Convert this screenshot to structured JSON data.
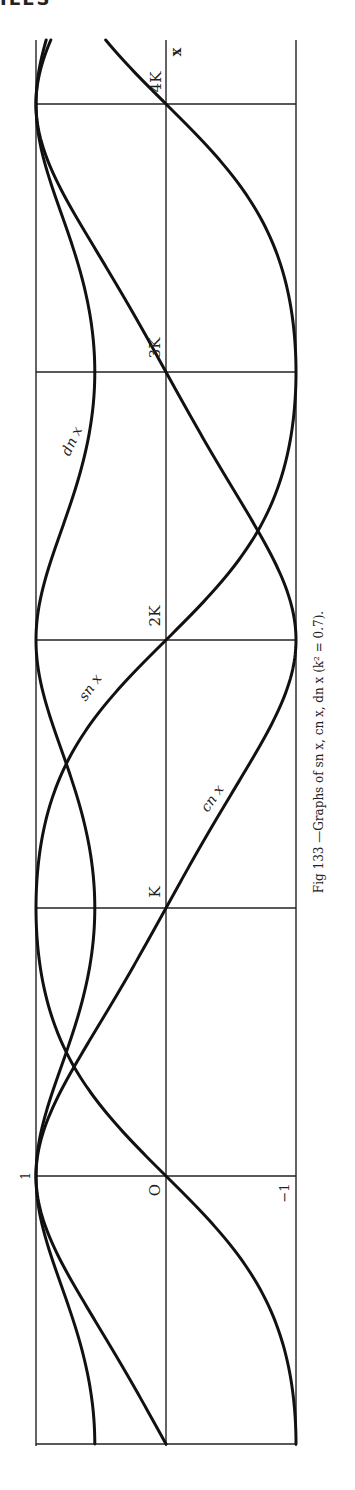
{
  "page": {
    "header_fragment": "ILES"
  },
  "figure": {
    "caption": "Fig 133 —Graphs of sn x, cn x, dn x (k² = 0.7).",
    "orientation": "rotated 90° counter-clockwise (x axis runs bottom to top)"
  },
  "chart_data": {
    "type": "line",
    "title": "Graphs of sn x, cn x, dn x (k² = 0.7)",
    "figure_number": "Fig 133",
    "parameter": {
      "k_squared": 0.7,
      "K_value": 2.0754
    },
    "xlabel": "x",
    "ylabel": "",
    "x_tick_labels": [
      "O",
      "K",
      "2K",
      "3K",
      "4K"
    ],
    "x_ticks_in_K": [
      0,
      1,
      2,
      3,
      4
    ],
    "y_tick_labels": [
      "1",
      "O",
      "−1"
    ],
    "y_ticks": [
      1,
      0,
      -1
    ],
    "xlim_in_K": [
      -1,
      4.25
    ],
    "ylim": [
      -1,
      1
    ],
    "grid": true,
    "x_in_K": [
      -1,
      -0.75,
      -0.5,
      -0.25,
      0,
      0.25,
      0.5,
      0.75,
      1,
      1.25,
      1.5,
      1.75,
      2,
      2.25,
      2.5,
      2.75,
      3,
      3.25,
      3.5,
      3.75,
      4,
      4.25
    ],
    "series": [
      {
        "name": "sn x",
        "label_at_in_K": 1.6,
        "values": [
          -1.0,
          -0.96,
          -0.804,
          -0.44,
          0.0,
          0.44,
          0.804,
          0.96,
          1.0,
          0.96,
          0.804,
          0.44,
          0.0,
          -0.44,
          -0.804,
          -0.96,
          -1.0,
          -0.96,
          -0.804,
          -0.44,
          0.0,
          0.44
        ]
      },
      {
        "name": "cn x",
        "label_at_in_K": 0.55,
        "values": [
          0.0,
          0.28,
          0.595,
          0.898,
          1.0,
          0.898,
          0.595,
          0.28,
          0.0,
          -0.28,
          -0.595,
          -0.898,
          -1.0,
          -0.898,
          -0.595,
          -0.28,
          0.0,
          0.28,
          0.595,
          0.898,
          1.0,
          0.898
        ]
      },
      {
        "name": "dn x",
        "label_at_in_K": 2.75,
        "values": [
          0.548,
          0.596,
          0.74,
          0.93,
          1.0,
          0.93,
          0.74,
          0.596,
          0.548,
          0.596,
          0.74,
          0.93,
          1.0,
          0.93,
          0.74,
          0.596,
          0.548,
          0.596,
          0.74,
          0.93,
          1.0,
          0.93
        ]
      }
    ]
  },
  "labels": {
    "x_axis_name": "x",
    "tick_O": "O",
    "tick_K": "K",
    "tick_2K": "2K",
    "tick_3K": "3K",
    "tick_4K": "4K",
    "y_one": "1",
    "y_minus_one": "−1",
    "sn": "sn x",
    "cn": "cn x",
    "dn": "dn x"
  }
}
